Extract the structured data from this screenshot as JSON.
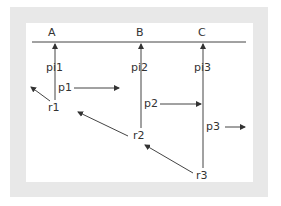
{
  "diagram": {
    "colors": {
      "frame": "#e8e8e8",
      "panel": "#ffffff",
      "line": "#333333",
      "text": "#333333"
    },
    "columns": [
      {
        "id": "A",
        "label": "A"
      },
      {
        "id": "B",
        "label": "B"
      },
      {
        "id": "C",
        "label": "C"
      }
    ],
    "pointers": [
      {
        "id": "pi1",
        "label": "pi1"
      },
      {
        "id": "pi2",
        "label": "pi2"
      },
      {
        "id": "pi3",
        "label": "pi3"
      }
    ],
    "processes": [
      {
        "id": "p1",
        "label": "p1"
      },
      {
        "id": "p2",
        "label": "p2"
      },
      {
        "id": "p3",
        "label": "p3"
      }
    ],
    "refs": [
      {
        "id": "r1",
        "label": "r1"
      },
      {
        "id": "r2",
        "label": "r2"
      },
      {
        "id": "r3",
        "label": "r3"
      }
    ]
  }
}
